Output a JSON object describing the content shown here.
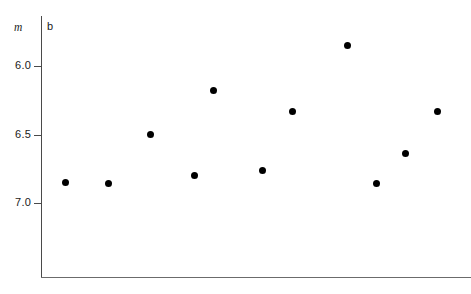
{
  "chart_data": {
    "type": "scatter",
    "title": "",
    "panel_label": "b",
    "xlabel": "",
    "ylabel": "m",
    "ylabel_style": "italic",
    "y_inverted": true,
    "ylim": [
      7.35,
      5.7
    ],
    "xlim": [
      0,
      1
    ],
    "grid": false,
    "legend": null,
    "y_ticks": [
      6.0,
      6.5,
      7.0
    ],
    "y_ticklabels": [
      "6.0",
      "6.5",
      "7.0"
    ],
    "x_ticks": [],
    "x_ticklabels": [],
    "marker": "filled-circle",
    "marker_color": "#000000",
    "marker_size_px": 7,
    "n_points": 11,
    "points": [
      {
        "x": 0.058,
        "y": 6.85
      },
      {
        "x": 0.156,
        "y": 6.86
      },
      {
        "x": 0.254,
        "y": 6.5
      },
      {
        "x": 0.356,
        "y": 6.8
      },
      {
        "x": 0.4,
        "y": 6.18
      },
      {
        "x": 0.516,
        "y": 6.76
      },
      {
        "x": 0.584,
        "y": 6.33
      },
      {
        "x": 0.712,
        "y": 5.85
      },
      {
        "x": 0.781,
        "y": 6.86
      },
      {
        "x": 0.847,
        "y": 6.64
      },
      {
        "x": 0.923,
        "y": 6.33
      }
    ]
  },
  "axes": {
    "y_axis_title": "m",
    "panel_tag": "b"
  }
}
